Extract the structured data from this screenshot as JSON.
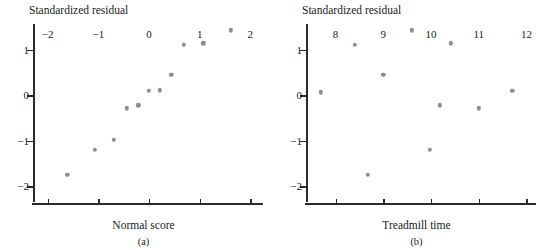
{
  "figure": {
    "panels": [
      {
        "id": "a",
        "caption": "(a)",
        "xlabel": "Normal score",
        "ylabel": "Standardized residual"
      },
      {
        "id": "b",
        "caption": "(b)",
        "xlabel": "Treadmill time",
        "ylabel": "Standardized residual"
      }
    ]
  },
  "chart_data": [
    {
      "type": "scatter",
      "title": "",
      "panel": "(a)",
      "xlabel": "Normal score",
      "ylabel": "Standardized residual",
      "xlim": [
        -2.29,
        2.25
      ],
      "ylim": [
        -2.41,
        1.66
      ],
      "xticks": [
        -2,
        -1,
        0,
        1,
        2
      ],
      "xticklabels": [
        "−2",
        "−1",
        "0",
        "1",
        "2"
      ],
      "yticks": [
        1,
        0,
        -1,
        -2
      ],
      "yticklabels": [
        "1",
        "0",
        "−1",
        "−2"
      ],
      "grid": false,
      "legend": false,
      "x": [
        -1.61,
        -1.07,
        -0.69,
        -0.44,
        -0.21,
        0.0,
        0.21,
        0.44,
        0.69,
        1.07,
        1.61
      ],
      "y": [
        -1.74,
        -1.2,
        -0.97,
        -0.28,
        -0.22,
        0.1,
        0.11,
        0.45,
        1.12,
        1.15,
        1.43
      ]
    },
    {
      "type": "scatter",
      "title": "",
      "panel": "(b)",
      "xlabel": "Treadmill time",
      "ylabel": "Standardized residual",
      "xlim": [
        7.38,
        12.2
      ],
      "ylim": [
        -2.41,
        1.66
      ],
      "xticks": [
        8,
        9,
        10,
        11,
        12
      ],
      "xticklabels": [
        "8",
        "9",
        "10",
        "11",
        "12"
      ],
      "yticks": [
        1,
        0,
        -1,
        -2
      ],
      "yticklabels": [
        "1",
        "0",
        "−1",
        "−2"
      ],
      "grid": false,
      "legend": false,
      "x": [
        7.69,
        8.4,
        8.67,
        9.0,
        9.6,
        9.97,
        10.18,
        10.42,
        11.0,
        11.7
      ],
      "y": [
        0.07,
        1.12,
        -1.74,
        0.45,
        1.43,
        -1.2,
        -0.22,
        1.15,
        -0.28,
        0.1
      ]
    }
  ]
}
